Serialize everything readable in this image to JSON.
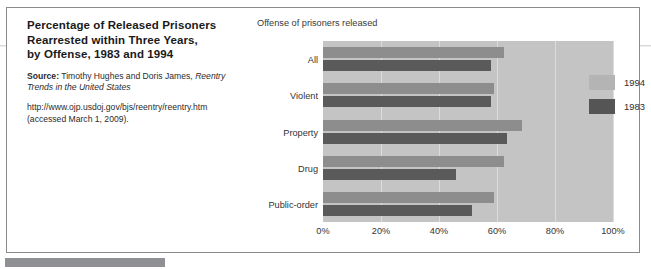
{
  "caption": {
    "title_line1": "Percentage of Released Prisoners",
    "title_line2": "Rearrested within Three Years,",
    "title_line3": "by Offense, 1983 and 1994",
    "source_label": "Source:",
    "source_authors": " Timothy Hughes and Doris James, ",
    "source_work": "Reentry Trends in the United States",
    "url": "http://www.ojp.usdoj.gov/bjs/reentry/reentry.htm",
    "accessed": "(accessed March 1, 2009)."
  },
  "chart_data": {
    "type": "bar",
    "orientation": "horizontal",
    "title": "Offense of prisoners released",
    "xlabel": "",
    "ylabel": "",
    "categories": [
      "All",
      "Violent",
      "Property",
      "Drug",
      "Public-order"
    ],
    "series": [
      {
        "name": "1994",
        "color": "#8d8d8d",
        "values": [
          62.5,
          59.0,
          68.5,
          62.5,
          59.0
        ]
      },
      {
        "name": "1983",
        "color": "#5a5a5a",
        "values": [
          58.0,
          58.0,
          63.5,
          46.0,
          51.5
        ]
      }
    ],
    "xlim": [
      0,
      100
    ],
    "xticks": [
      "0%",
      "20%",
      "40%",
      "60%",
      "80%",
      "100%"
    ],
    "xtick_values": [
      0,
      20,
      40,
      60,
      80,
      100
    ],
    "grid": true,
    "legend_position": "inside-right",
    "plot_background": "#c4c4c4"
  }
}
